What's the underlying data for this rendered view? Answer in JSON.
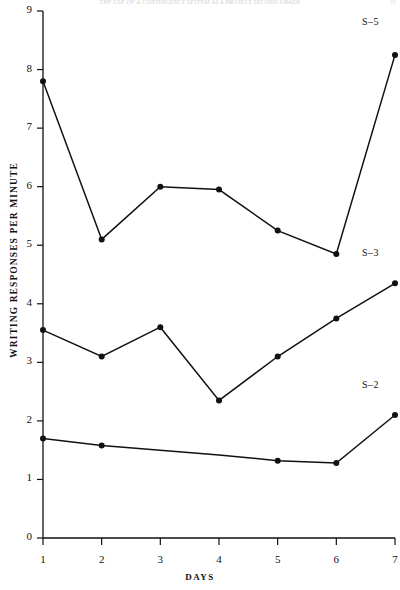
{
  "header": {
    "running_head": "THE USE OF A CONTINGENCY SYSTEM AS A PROJECT SECOND GRADE",
    "page_number": "21"
  },
  "chart_data": {
    "type": "line",
    "title": "",
    "xlabel": "DAYS",
    "ylabel": "WRITING RESPONSES PER MINUTE",
    "x": [
      1,
      2,
      3,
      4,
      5,
      6,
      7
    ],
    "xtick_labels": [
      "1",
      "2",
      "3",
      "4",
      "5",
      "6",
      "7"
    ],
    "ytick_labels": [
      "0",
      "1",
      "2",
      "3",
      "4",
      "5",
      "6",
      "7",
      "8",
      "9"
    ],
    "xlim": [
      1,
      7
    ],
    "ylim": [
      0,
      9
    ],
    "grid": false,
    "legend_position": "right-inline",
    "series": [
      {
        "name": "S-5",
        "label": "S–5",
        "values": [
          7.8,
          5.1,
          6.0,
          5.95,
          5.25,
          4.85,
          8.25
        ],
        "markers": [
          true,
          true,
          true,
          true,
          true,
          true,
          true
        ],
        "label_x": 7,
        "label_y": 8.8
      },
      {
        "name": "S-3",
        "label": "S–3",
        "values": [
          3.55,
          3.1,
          3.6,
          2.35,
          3.1,
          3.75,
          4.35
        ],
        "markers": [
          true,
          true,
          true,
          true,
          true,
          true,
          true
        ],
        "label_x": 7,
        "label_y": 4.85
      },
      {
        "name": "S-2",
        "label": "S–2",
        "values": [
          1.7,
          1.58,
          1.5,
          1.42,
          1.32,
          1.28,
          2.1
        ],
        "markers": [
          true,
          true,
          false,
          false,
          true,
          true,
          true
        ],
        "label_x": 7,
        "label_y": 2.6
      }
    ]
  },
  "colors": {
    "line": "#111111",
    "axis": "#111111",
    "background": "#ffffff"
  }
}
